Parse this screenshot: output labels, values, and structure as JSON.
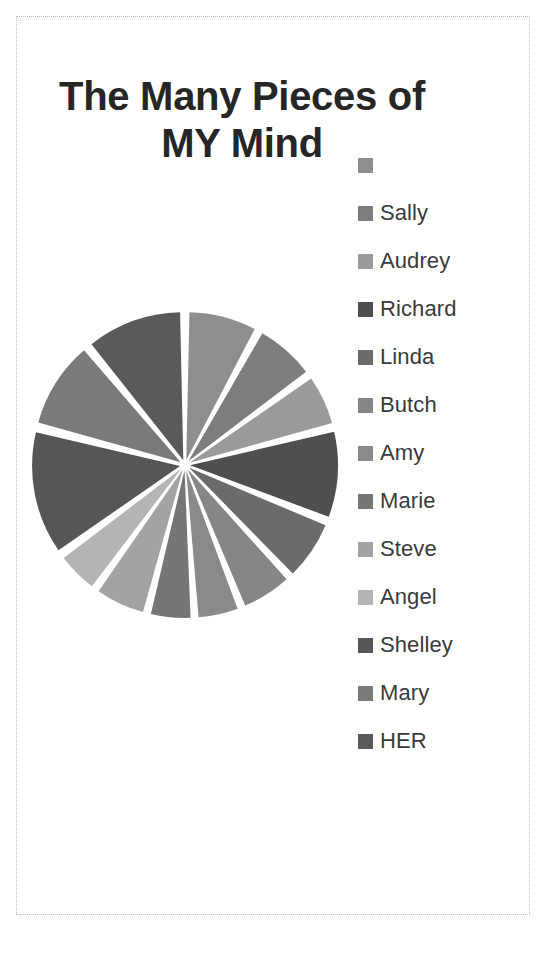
{
  "page": {
    "background_color": "#ffffff",
    "border_color": "#b9b9b9"
  },
  "title": {
    "line1": "The Many Pieces of",
    "line2": "MY Mind",
    "color": "#262626"
  },
  "legend": {
    "position": "right",
    "items": [
      {
        "label": "",
        "color": "#8e8e8e"
      },
      {
        "label": "Sally",
        "color": "#7d7d7d"
      },
      {
        "label": "Audrey",
        "color": "#9a9a9a"
      },
      {
        "label": "Richard",
        "color": "#4f4f4f"
      },
      {
        "label": "Linda",
        "color": "#6b6b6b"
      },
      {
        "label": "Butch",
        "color": "#868686"
      },
      {
        "label": "Amy",
        "color": "#8a8a8a"
      },
      {
        "label": "Marie",
        "color": "#767676"
      },
      {
        "label": "Steve",
        "color": "#a3a3a3"
      },
      {
        "label": "Angel",
        "color": "#b4b4b4"
      },
      {
        "label": "Shelley",
        "color": "#565656"
      },
      {
        "label": "Mary",
        "color": "#7a7a7a"
      },
      {
        "label": "HER",
        "color": "#5a5a5a"
      }
    ]
  },
  "chart_data": {
    "type": "pie",
    "title": "The Many Pieces of MY Mind",
    "xlabel": "",
    "ylabel": "",
    "legend_position": "right",
    "exploded": true,
    "gap_degrees": 2.5,
    "center": {
      "x": 160,
      "y": 160
    },
    "radius": 148,
    "start_angle_deg": -90,
    "categories": [
      "",
      "Sally",
      "Audrey",
      "Richard",
      "Linda",
      "Butch",
      "Amy",
      "Marie",
      "Steve",
      "Angel",
      "Shelley",
      "Mary",
      "HER"
    ],
    "values": [
      8,
      7,
      6,
      10,
      7,
      6,
      5,
      5,
      6,
      5,
      14,
      10,
      11
    ],
    "colors": [
      "#8e8e8e",
      "#7d7d7d",
      "#9a9a9a",
      "#4f4f4f",
      "#6b6b6b",
      "#868686",
      "#8a8a8a",
      "#767676",
      "#a3a3a3",
      "#b4b4b4",
      "#565656",
      "#7a7a7a",
      "#5a5a5a"
    ],
    "slices": [
      {
        "label": "",
        "value": 8,
        "color": "#8e8e8e",
        "start_deg": -90,
        "end_deg": -61.2
      },
      {
        "label": "Sally",
        "value": 7,
        "color": "#7d7d7d",
        "start_deg": -61.2,
        "end_deg": -36.0
      },
      {
        "label": "Audrey",
        "value": 6,
        "color": "#9a9a9a",
        "start_deg": -36.0,
        "end_deg": -14.4
      },
      {
        "label": "Richard",
        "value": 10,
        "color": "#4f4f4f",
        "start_deg": -14.4,
        "end_deg": 21.6
      },
      {
        "label": "Linda",
        "value": 7,
        "color": "#6b6b6b",
        "start_deg": 21.6,
        "end_deg": 46.8
      },
      {
        "label": "Butch",
        "value": 6,
        "color": "#868686",
        "start_deg": 46.8,
        "end_deg": 68.4
      },
      {
        "label": "Amy",
        "value": 5,
        "color": "#8a8a8a",
        "start_deg": 68.4,
        "end_deg": 86.4
      },
      {
        "label": "Marie",
        "value": 5,
        "color": "#767676",
        "start_deg": 86.4,
        "end_deg": 104.4
      },
      {
        "label": "Steve",
        "value": 6,
        "color": "#a3a3a3",
        "start_deg": 104.4,
        "end_deg": 126.0
      },
      {
        "label": "Angel",
        "value": 5,
        "color": "#b4b4b4",
        "start_deg": 126.0,
        "end_deg": 144.0
      },
      {
        "label": "Shelley",
        "value": 14,
        "color": "#565656",
        "start_deg": 144.0,
        "end_deg": 194.4
      },
      {
        "label": "Mary",
        "value": 10,
        "color": "#7a7a7a",
        "start_deg": 194.4,
        "end_deg": 230.4
      },
      {
        "label": "HER",
        "value": 11,
        "color": "#5a5a5a",
        "start_deg": 230.4,
        "end_deg": 270.0
      }
    ]
  }
}
